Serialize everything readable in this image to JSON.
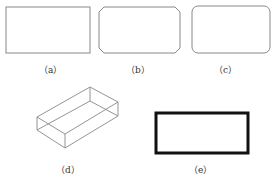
{
  "figure": {
    "panels": [
      {
        "id": "a",
        "label": "（a）",
        "shape": "rectangle"
      },
      {
        "id": "b",
        "label": "（b）",
        "shape": "chamfered-rectangle"
      },
      {
        "id": "c",
        "label": "（c）",
        "shape": "rounded-rectangle"
      },
      {
        "id": "d",
        "label": "（d）",
        "shape": "3d-box"
      },
      {
        "id": "e",
        "label": "（e）",
        "shape": "thick-border-rectangle"
      }
    ]
  },
  "colors": {
    "thin_stroke": "#888888",
    "thick_stroke": "#111111",
    "label": "#333333",
    "background": "#ffffff"
  }
}
